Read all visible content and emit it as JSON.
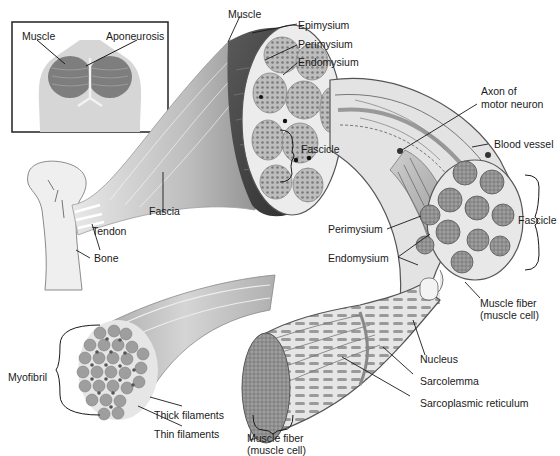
{
  "diagram": {
    "inset": {
      "labels": {
        "muscle": "Muscle",
        "aponeurosis": "Aponeurosis"
      }
    },
    "labels": {
      "muscle": "Muscle",
      "epimysium": "Epimysium",
      "perimysium_top": "Perimysium",
      "endomysium_top": "Endomysium",
      "axon_line1": "Axon of",
      "axon_line2": "motor neuron",
      "blood_vessel": "Blood vessel",
      "fascicle_left": "Fascicle",
      "fascicle_right": "Fascicle",
      "tendon": "Tendon",
      "fascia": "Fascia",
      "bone": "Bone",
      "perimysium_mid": "Perimysium",
      "endomysium_mid": "Endomysium",
      "muscle_fiber_right_line1": "Muscle fiber",
      "muscle_fiber_right_line2": "(muscle cell)",
      "nucleus": "Nucleus",
      "sarcolemma": "Sarcolemma",
      "sarcoplasmic_reticulum": "Sarcoplasmic reticulum",
      "myofibril": "Myofibril",
      "thick_filaments": "Thick filaments",
      "thin_filaments": "Thin filaments",
      "muscle_fiber_bottom_line1": "Muscle fiber",
      "muscle_fiber_bottom_line2": "(muscle cell)"
    },
    "colors": {
      "line": "#1a1a1a",
      "muscle_dark": "#4a4a4a",
      "muscle_mid": "#8a8a8a",
      "tissue_light": "#d9d9d9",
      "fascicle_fill": "#b5b5b5",
      "bone": "#ececec",
      "background": "#ffffff"
    }
  }
}
